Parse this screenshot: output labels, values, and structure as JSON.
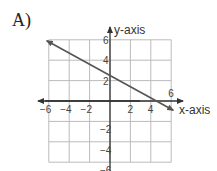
{
  "option_label": "A)",
  "chart_data": {
    "type": "line",
    "title": "",
    "xlabel": "x-axis",
    "ylabel": "y-axis",
    "xlim": [
      -6,
      6
    ],
    "ylim": [
      -6,
      6
    ],
    "grid": true,
    "grid_step": 2,
    "x_ticks": [
      "-6",
      "-4",
      "-2",
      "2",
      "4",
      "6"
    ],
    "y_ticks": [
      "6",
      "4",
      "2",
      "-2",
      "-4",
      "-6"
    ],
    "series": [
      {
        "name": "line",
        "x": [
          -6.2,
          0,
          4.5,
          6.2
        ],
        "y": [
          5.9,
          2.5,
          0,
          -0.9
        ],
        "arrows": "both",
        "color": "#555555"
      }
    ],
    "axis_color": "#333333",
    "grid_color": "#bbbbbb"
  }
}
